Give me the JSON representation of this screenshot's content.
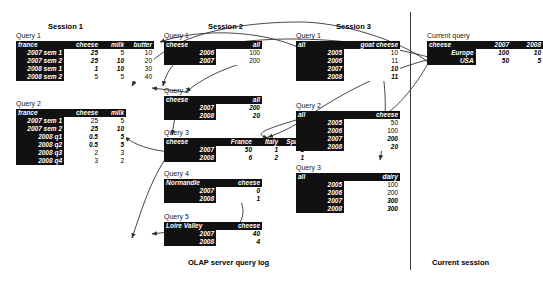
{
  "figure": {
    "footers": [
      {
        "name": "olap-log-label",
        "text": "OLAP server query log",
        "x": 188,
        "y": 258
      },
      {
        "name": "current-session-label",
        "text": "Current session",
        "x": 432,
        "y": 258
      }
    ],
    "divider": {
      "x": 410,
      "y": 12,
      "height": 258
    }
  },
  "sessions": [
    {
      "id": "session-1",
      "title": "Session 1",
      "title_x": 48,
      "title_y": 22,
      "queries": [
        {
          "label": "Query 1",
          "label_x": 16,
          "label_y": 32,
          "x": 16,
          "y": 41,
          "corner": "france",
          "columns": [
            "cheese",
            "milk",
            "butter"
          ],
          "label_w": 44,
          "col_w": [
            32,
            22,
            24
          ],
          "rows": [
            {
              "label": "2007 sem 1",
              "values": [
                "25",
                "5",
                "10"
              ],
              "bold": [
                true,
                false,
                false
              ]
            },
            {
              "label": "2007 sem 2",
              "values": [
                "25",
                "10",
                "20"
              ],
              "bold": [
                true,
                true,
                false
              ]
            },
            {
              "label": "2008 sem 1",
              "values": [
                "1",
                "10",
                "30"
              ],
              "bold": [
                true,
                true,
                false
              ]
            },
            {
              "label": "2008 sem 2",
              "values": [
                "5",
                "5",
                "40"
              ],
              "bold": [
                false,
                false,
                false
              ]
            }
          ]
        },
        {
          "label": "Query 2",
          "label_x": 16,
          "label_y": 100,
          "x": 16,
          "y": 109,
          "corner": "france",
          "columns": [
            "cheese",
            "milk"
          ],
          "label_w": 44,
          "col_w": [
            32,
            22
          ],
          "rows": [
            {
              "label": "2007 sem 1",
              "values": [
                "25",
                "5"
              ],
              "bold": [
                false,
                false
              ]
            },
            {
              "label": "2007 sem 2",
              "values": [
                "25",
                "10"
              ],
              "bold": [
                true,
                true
              ]
            },
            {
              "label": "2008 q1",
              "values": [
                "0.5",
                "5"
              ],
              "bold": [
                true,
                true
              ]
            },
            {
              "label": "2008 q2",
              "values": [
                "0.5",
                "5"
              ],
              "bold": [
                true,
                true
              ]
            },
            {
              "label": "2008 q3",
              "values": [
                "2",
                "3"
              ],
              "bold": [
                false,
                false
              ]
            },
            {
              "label": "2008 q4",
              "values": [
                "3",
                "2"
              ],
              "bold": [
                false,
                false
              ]
            }
          ]
        }
      ]
    },
    {
      "id": "session-2",
      "title": "Session 2",
      "title_x": 208,
      "title_y": 22,
      "queries": [
        {
          "label": "Query 1",
          "label_x": 164,
          "label_y": 32,
          "x": 164,
          "y": 41,
          "corner": "cheese",
          "columns": [
            "all"
          ],
          "label_w": 48,
          "col_w": [
            42
          ],
          "rows": [
            {
              "label": "2006",
              "values": [
                "100"
              ],
              "bold": [
                false
              ]
            },
            {
              "label": "2007",
              "values": [
                "200"
              ],
              "bold": [
                false
              ]
            }
          ]
        },
        {
          "label": "Query 2",
          "label_x": 164,
          "label_y": 87,
          "x": 164,
          "y": 96,
          "corner": "cheese",
          "columns": [
            "all"
          ],
          "label_w": 48,
          "col_w": [
            42
          ],
          "rows": [
            {
              "label": "2007",
              "values": [
                "200"
              ],
              "bold": [
                true
              ]
            },
            {
              "label": "2008",
              "values": [
                "20"
              ],
              "bold": [
                true
              ]
            }
          ]
        },
        {
          "label": "Query 3",
          "label_x": 164,
          "label_y": 129,
          "x": 164,
          "y": 138,
          "corner": "cheese",
          "columns": [
            "France",
            "Italy",
            "Spain"
          ],
          "label_w": 48,
          "col_w": [
            34,
            22,
            22
          ],
          "rows": [
            {
              "label": "2007",
              "values": [
                "50",
                "1",
                "1"
              ],
              "bold": [
                true,
                true,
                true
              ]
            },
            {
              "label": "2008",
              "values": [
                "6",
                "2",
                "1"
              ],
              "bold": [
                true,
                true,
                true
              ]
            }
          ]
        },
        {
          "label": "Query 4",
          "label_x": 164,
          "label_y": 170,
          "x": 164,
          "y": 179,
          "corner": "Normandie",
          "columns": [
            "cheese"
          ],
          "label_w": 48,
          "col_w": [
            42
          ],
          "rows": [
            {
              "label": "2007",
              "values": [
                "0"
              ],
              "bold": [
                true
              ]
            },
            {
              "label": "2008",
              "values": [
                "1"
              ],
              "bold": [
                true
              ]
            }
          ]
        },
        {
          "label": "Query 5",
          "label_x": 164,
          "label_y": 213,
          "x": 164,
          "y": 222,
          "corner": "Loire Valley",
          "columns": [
            "cheese"
          ],
          "label_w": 48,
          "col_w": [
            42
          ],
          "rows": [
            {
              "label": "2007",
              "values": [
                "40"
              ],
              "bold": [
                true
              ]
            },
            {
              "label": "2008",
              "values": [
                "4"
              ],
              "bold": [
                true
              ]
            }
          ]
        }
      ]
    },
    {
      "id": "session-3",
      "title": "Session 3",
      "title_x": 336,
      "title_y": 22,
      "queries": [
        {
          "label": "Query 1",
          "label_x": 296,
          "label_y": 32,
          "x": 296,
          "y": 41,
          "corner": "all",
          "columns": [
            "goat cheese"
          ],
          "label_w": 44,
          "col_w": [
            52
          ],
          "rows": [
            {
              "label": "2005",
              "values": [
                "10"
              ],
              "bold": [
                false
              ]
            },
            {
              "label": "2006",
              "values": [
                "11"
              ],
              "bold": [
                false
              ]
            },
            {
              "label": "2007",
              "values": [
                "10"
              ],
              "bold": [
                true
              ]
            },
            {
              "label": "2008",
              "values": [
                "11"
              ],
              "bold": [
                true
              ]
            }
          ]
        },
        {
          "label": "Query 2",
          "label_x": 296,
          "label_y": 102,
          "x": 296,
          "y": 111,
          "corner": "all",
          "columns": [
            "cheese"
          ],
          "label_w": 44,
          "col_w": [
            52
          ],
          "rows": [
            {
              "label": "2005",
              "values": [
                "50"
              ],
              "bold": [
                false
              ]
            },
            {
              "label": "2006",
              "values": [
                "100"
              ],
              "bold": [
                false
              ]
            },
            {
              "label": "2007",
              "values": [
                "200"
              ],
              "bold": [
                true
              ]
            },
            {
              "label": "2008",
              "values": [
                "20"
              ],
              "bold": [
                true
              ]
            }
          ]
        },
        {
          "label": "Query 3",
          "label_x": 296,
          "label_y": 164,
          "x": 296,
          "y": 173,
          "corner": "all",
          "columns": [
            "dairy"
          ],
          "label_w": 44,
          "col_w": [
            52
          ],
          "rows": [
            {
              "label": "2005",
              "values": [
                "100"
              ],
              "bold": [
                false
              ]
            },
            {
              "label": "2006",
              "values": [
                "200"
              ],
              "bold": [
                false
              ]
            },
            {
              "label": "2007",
              "values": [
                "300"
              ],
              "bold": [
                true
              ]
            },
            {
              "label": "2008",
              "values": [
                "300"
              ],
              "bold": [
                true
              ]
            }
          ]
        }
      ]
    },
    {
      "id": "current-session",
      "title": "",
      "title_x": 0,
      "title_y": 0,
      "queries": [
        {
          "label": "Current query",
          "label_x": 427,
          "label_y": 32,
          "x": 427,
          "y": 41,
          "corner": "cheese",
          "columns": [
            "2007",
            "2008"
          ],
          "label_w": 48,
          "col_w": [
            34,
            30
          ],
          "rows": [
            {
              "label": "Europe",
              "values": [
                "100",
                "10"
              ],
              "bold": [
                true,
                true
              ]
            },
            {
              "label": "USA",
              "values": [
                "50",
                "5"
              ],
              "bold": [
                true,
                true
              ]
            }
          ]
        }
      ]
    }
  ],
  "arrows": [
    {
      "name": "arrow-current-to-s1q1",
      "d": "M 432,58 C 330,30 240,38 196,50 C 176,56 166,72 163,86"
    },
    {
      "name": "arrow-s2q1-to-s1q1",
      "d": "M 243,63 C 220,70 200,80 186,92"
    },
    {
      "name": "arrow-to-s1q1-tip",
      "d": "M 186,92 L 152,88"
    },
    {
      "name": "arrow-s2q2-down",
      "d": "M 175,117 L 172,135"
    },
    {
      "name": "arrow-cur-to-s2q3",
      "d": "M 427,60 C 380,72 330,100 300,122 C 290,128 278,134 268,137"
    },
    {
      "name": "arrow-s2q3-to-s1q2",
      "d": "M 170,152 C 150,150 135,145 125,137"
    },
    {
      "name": "arrow-s2q3-to-left",
      "d": "M 168,155 C 150,180 140,215 132,238"
    },
    {
      "name": "arrow-s2q5-to-q4",
      "d": "M 230,232 C 248,222 246,200 232,192"
    },
    {
      "name": "arrow-s2q5-left",
      "d": "M 168,232 L 152,234"
    },
    {
      "name": "arrow-cur-to-s3q1",
      "d": "M 428,62 C 400,40 340,22 300,22 C 250,22 200,30 170,48 C 150,60 140,72 132,86"
    },
    {
      "name": "arrow-s3q1-leftarc",
      "d": "M 300,48 C 260,30 200,28 160,42"
    },
    {
      "name": "arrow-cur-to-s3q2",
      "d": "M 430,60 C 420,78 400,110 372,122"
    },
    {
      "name": "arrow-s3q2-to-s2q3",
      "d": "M 296,120 C 270,128 250,134 268,138"
    },
    {
      "name": "arrow-s3-vert",
      "d": "M 380,60 C 388,90 386,130 380,160"
    }
  ]
}
